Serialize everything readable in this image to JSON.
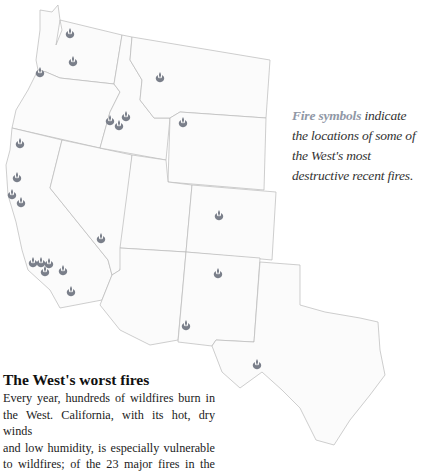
{
  "legend": {
    "lead": "Fire symbols",
    "rest": " indicate the locations of some of the West's most destructive recent fires."
  },
  "story": {
    "title": "The West's worst fires",
    "body_lines": [
      "Every year, hundreds of wildfires burn in",
      "the West. California, with its hot, dry winds",
      "and low humidity, is especially vulnerable",
      "to wildfires; of the 23 major fires in the"
    ]
  },
  "map": {
    "icon": "fire-symbol-icon",
    "colors": {
      "fire": "#7a7f8a",
      "state_fill": "#fbfbfb",
      "state_border": "#b9b9b9",
      "legend_lead": "#9098a6"
    },
    "fire_locations": [
      {
        "state": "Washington",
        "x": 70,
        "y": 33
      },
      {
        "state": "Washington",
        "x": 73,
        "y": 61
      },
      {
        "state": "Oregon/Washington border",
        "x": 40,
        "y": 72
      },
      {
        "state": "Montana",
        "x": 160,
        "y": 77
      },
      {
        "state": "Idaho",
        "x": 110,
        "y": 120
      },
      {
        "state": "Idaho",
        "x": 126,
        "y": 116
      },
      {
        "state": "Idaho",
        "x": 119,
        "y": 125
      },
      {
        "state": "Wyoming",
        "x": 183,
        "y": 122
      },
      {
        "state": "California",
        "x": 20,
        "y": 143
      },
      {
        "state": "California",
        "x": 17,
        "y": 177
      },
      {
        "state": "California",
        "x": 12,
        "y": 194
      },
      {
        "state": "California",
        "x": 21,
        "y": 202
      },
      {
        "state": "California",
        "x": 101,
        "y": 238
      },
      {
        "state": "California",
        "x": 33,
        "y": 262
      },
      {
        "state": "California",
        "x": 41,
        "y": 262
      },
      {
        "state": "California",
        "x": 49,
        "y": 263
      },
      {
        "state": "California",
        "x": 45,
        "y": 271
      },
      {
        "state": "California",
        "x": 63,
        "y": 270
      },
      {
        "state": "California",
        "x": 71,
        "y": 291
      },
      {
        "state": "Colorado",
        "x": 219,
        "y": 215
      },
      {
        "state": "New Mexico",
        "x": 218,
        "y": 273
      },
      {
        "state": "Arizona",
        "x": 186,
        "y": 325
      },
      {
        "state": "Texas",
        "x": 257,
        "y": 364
      }
    ]
  }
}
